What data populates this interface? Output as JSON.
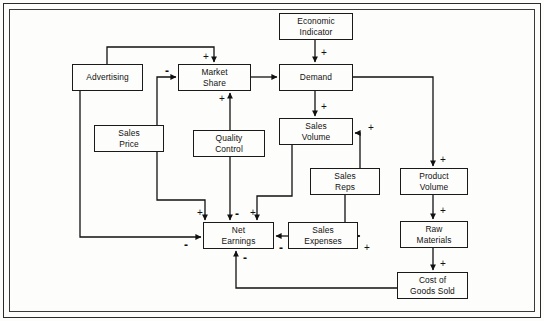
{
  "diagram": {
    "type": "causal-loop-diagram",
    "nodes": [
      {
        "id": "economic_indicator",
        "label_line1": "Economic",
        "label_line2": "Indicator",
        "x": 279,
        "y": 13,
        "w": 74,
        "h": 27
      },
      {
        "id": "advertising",
        "label_line1": "Advertising",
        "label_line2": "",
        "x": 72,
        "y": 64,
        "w": 71,
        "h": 27
      },
      {
        "id": "market_share",
        "label_line1": "Market",
        "label_line2": "Share",
        "x": 178,
        "y": 64,
        "w": 73,
        "h": 27
      },
      {
        "id": "demand",
        "label_line1": "Demand",
        "label_line2": "",
        "x": 279,
        "y": 64,
        "w": 74,
        "h": 27
      },
      {
        "id": "sales_price",
        "label_line1": "Sales",
        "label_line2": "Price",
        "x": 94,
        "y": 125,
        "w": 70,
        "h": 27
      },
      {
        "id": "sales_volume",
        "label_line1": "Sales",
        "label_line2": "Volume",
        "x": 279,
        "y": 118,
        "w": 74,
        "h": 27
      },
      {
        "id": "quality_control",
        "label_line1": "Quality",
        "label_line2": "Control",
        "x": 193,
        "y": 130,
        "w": 72,
        "h": 27
      },
      {
        "id": "sales_reps",
        "label_line1": "Sales",
        "label_line2": "Reps",
        "x": 310,
        "y": 168,
        "w": 70,
        "h": 27
      },
      {
        "id": "product_volume",
        "label_line1": "Product",
        "label_line2": "Volume",
        "x": 400,
        "y": 168,
        "w": 68,
        "h": 27
      },
      {
        "id": "net_earnings",
        "label_line1": "Net",
        "label_line2": "Earnings",
        "x": 203,
        "y": 222,
        "w": 71,
        "h": 27
      },
      {
        "id": "sales_expenses",
        "label_line1": "Sales",
        "label_line2": "Expenses",
        "x": 288,
        "y": 222,
        "w": 70,
        "h": 27
      },
      {
        "id": "raw_materials",
        "label_line1": "Raw",
        "label_line2": "Materials",
        "x": 400,
        "y": 221,
        "w": 68,
        "h": 27
      },
      {
        "id": "cost_of_goods_sold",
        "label_line1": "Cost of",
        "label_line2": "Goods Sold",
        "x": 397,
        "y": 272,
        "w": 71,
        "h": 27
      }
    ],
    "links": [
      {
        "id": "advertising-to-market-share",
        "from": "advertising",
        "to": "market_share",
        "polarity": "+",
        "sign_x": 203,
        "sign_y": 52,
        "path": "M 107 64 L 107 47 L 214 47 L 214 62"
      },
      {
        "id": "sales-price-to-market-share",
        "from": "sales_price",
        "to": "market_share",
        "polarity": "-",
        "sign_x": 165,
        "sign_y": 66,
        "path": "M 157 125 L 157 77 L 176 77"
      },
      {
        "id": "quality-control-to-market-share",
        "from": "quality_control",
        "to": "market_share",
        "polarity": "+",
        "sign_x": 219,
        "sign_y": 94,
        "path": "M 230 130 L 230 93"
      },
      {
        "id": "market-share-to-demand",
        "from": "market_share",
        "to": "demand",
        "polarity": "",
        "sign_x": 0,
        "sign_y": 0,
        "path": "M 251 77 L 277 77"
      },
      {
        "id": "economic-indicator-to-demand",
        "from": "economic_indicator",
        "to": "demand",
        "polarity": "+",
        "sign_x": 321,
        "sign_y": 48,
        "path": "M 315 40 L 315 62"
      },
      {
        "id": "demand-to-sales-volume",
        "from": "demand",
        "to": "sales_volume",
        "polarity": "+",
        "sign_x": 321,
        "sign_y": 102,
        "path": "M 315 91 L 315 116"
      },
      {
        "id": "sales-reps-to-sales-volume",
        "from": "sales_reps",
        "to": "sales_volume",
        "polarity": "+",
        "sign_x": 368,
        "sign_y": 123,
        "path": "M 360 168 L 360 133 L 355 133"
      },
      {
        "id": "demand-to-product-volume",
        "from": "demand",
        "to": "product_volume",
        "polarity": "+",
        "sign_x": 440,
        "sign_y": 155,
        "path": "M 353 77 L 433 77 L 433 166"
      },
      {
        "id": "product-volume-to-raw-materials",
        "from": "product_volume",
        "to": "raw_materials",
        "polarity": "+",
        "sign_x": 440,
        "sign_y": 206,
        "path": "M 433 195 L 433 219"
      },
      {
        "id": "raw-materials-to-cost-of-goods-sold",
        "from": "raw_materials",
        "to": "cost_of_goods_sold",
        "polarity": "+",
        "sign_x": 440,
        "sign_y": 259,
        "path": "M 433 248 L 433 270"
      },
      {
        "id": "sales-volume-to-net-earnings",
        "from": "sales_volume",
        "to": "net_earnings",
        "polarity": "+",
        "sign_x": 250,
        "sign_y": 208,
        "path": "M 292 145 L 292 196 L 257 196 L 257 220"
      },
      {
        "id": "sales-price-to-net-earnings",
        "from": "sales_price",
        "to": "net_earnings",
        "polarity": "+",
        "sign_x": 197,
        "sign_y": 208,
        "path": "M 157 152 L 157 200 L 205 200 L 205 220"
      },
      {
        "id": "quality-control-to-net-earnings",
        "from": "quality_control",
        "to": "net_earnings",
        "polarity": "-",
        "sign_x": 235,
        "sign_y": 209,
        "path": "M 230 157 L 230 220"
      },
      {
        "id": "advertising-to-net-earnings",
        "from": "advertising",
        "to": "net_earnings",
        "polarity": "-",
        "sign_x": 184,
        "sign_y": 240,
        "path": "M 80 91 L 80 237 L 201 237"
      },
      {
        "id": "sales-expenses-to-net-earnings",
        "from": "sales_expenses",
        "to": "net_earnings",
        "polarity": "-",
        "sign_x": 279,
        "sign_y": 243,
        "path": "M 288 236 L 276 236"
      },
      {
        "id": "sales-reps-to-sales-expenses",
        "from": "sales_reps",
        "to": "sales_expenses",
        "polarity": "+",
        "sign_x": 364,
        "sign_y": 243,
        "path": "M 345 195 L 345 236 L 360 236"
      },
      {
        "id": "cost-of-goods-sold-to-net-earnings",
        "from": "cost_of_goods_sold",
        "to": "net_earnings",
        "polarity": "-",
        "sign_x": 243,
        "sign_y": 253,
        "path": "M 397 288 L 236 288 L 236 251"
      }
    ]
  }
}
